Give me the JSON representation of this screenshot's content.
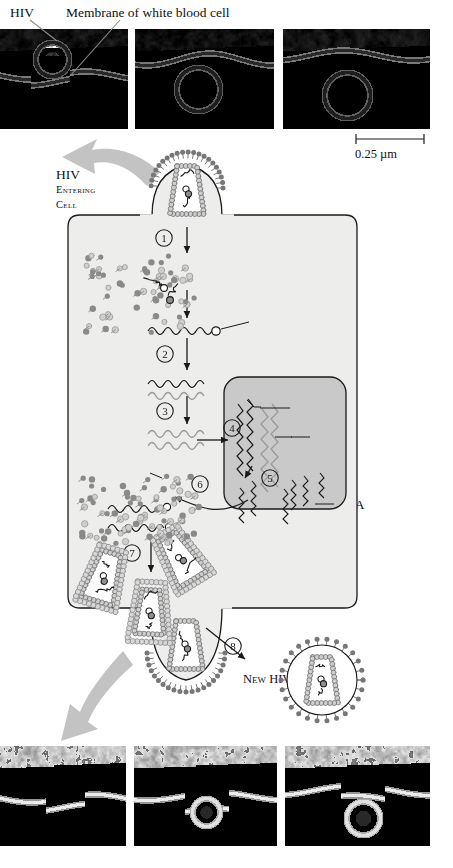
{
  "figure": {
    "scale_bar": "0.25 µm"
  },
  "top_micrographs": {
    "caption_hiv": "HIV",
    "caption_membrane": "Membrane of white blood cell",
    "panels": [
      {
        "name": "panel-1",
        "description": "HIV virion attached to white blood cell membrane"
      },
      {
        "name": "panel-2",
        "description": "HIV virion entering the cell membrane"
      },
      {
        "name": "panel-3",
        "description": "HIV virion engulfed by the cell membrane"
      }
    ]
  },
  "bottom_micrographs": {
    "panels": [
      {
        "name": "panel-1",
        "description": "Membrane beginning to bud"
      },
      {
        "name": "panel-2",
        "description": "Budding virion forming"
      },
      {
        "name": "panel-3",
        "description": "Newly released virion"
      }
    ]
  },
  "diagram": {
    "entering_label_main": "HIV",
    "entering_label_sub_1": "Entering",
    "entering_label_sub_2": "Cell",
    "host_cell_label": "Host cell",
    "nucleus_label": "Nucleus",
    "new_hiv_label": "New HIV",
    "labels": {
      "viral_rna": "Viral RNA",
      "reverse_transcriptase_1": "Reverse",
      "reverse_transcriptase_2": "transcriptase",
      "rna_dna_hybrid_1": "RNA-DNA",
      "rna_dna_hybrid_2": "hybrid",
      "dna": "DNA",
      "viral_proteins": "Viral proteins",
      "chromosomal_1": "Chromosomal",
      "chromosomal_2": "DNA",
      "provirus": "Provirus",
      "rna": "RNA"
    },
    "steps": [
      {
        "number": "1",
        "meaning": "virus core released into host cell"
      },
      {
        "number": "2",
        "meaning": "reverse transcription to RNA-DNA hybrid"
      },
      {
        "number": "3",
        "meaning": "synthesis of double-stranded DNA"
      },
      {
        "number": "4",
        "meaning": "DNA enters nucleus and integrates"
      },
      {
        "number": "5",
        "meaning": "transcription of provirus into RNA"
      },
      {
        "number": "6",
        "meaning": "RNA exits nucleus, viral proteins made"
      },
      {
        "number": "7",
        "meaning": "assembly of new virions"
      },
      {
        "number": "8",
        "meaning": "release of new HIV particle"
      }
    ]
  },
  "colors": {
    "host_cell_fill": "#ededec",
    "nucleus_fill": "#c9c9c9",
    "gray_arrow": "#c3c3c3",
    "outline": "#1a1a1a",
    "capsid_bead": "#cfcfcf",
    "spike_dark": "#777777",
    "protein_light": "#cfcfcf"
  }
}
